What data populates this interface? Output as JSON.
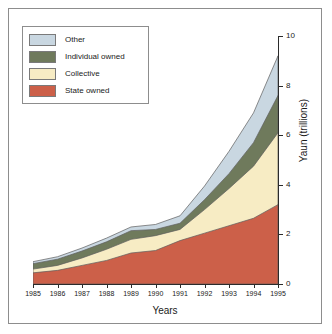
{
  "chart_data": {
    "type": "area",
    "title": "",
    "subtitle": "",
    "xlabel": "Years",
    "ylabel": "Yaun (trillions)",
    "x": [
      1985,
      1986,
      1987,
      1988,
      1989,
      1990,
      1991,
      1992,
      1993,
      1994,
      1995
    ],
    "categories": [
      "1985",
      "1986",
      "1987",
      "1988",
      "1989",
      "1990",
      "1991",
      "1992",
      "1993",
      "1994",
      "1995"
    ],
    "stacked": true,
    "series": [
      {
        "name": "State owned",
        "color": "#cc6049",
        "values": [
          0.45,
          0.55,
          0.75,
          0.95,
          1.25,
          1.35,
          1.75,
          2.05,
          2.35,
          2.65,
          3.2
        ]
      },
      {
        "name": "Collective",
        "color": "#f7ecc4",
        "values": [
          0.15,
          0.2,
          0.3,
          0.45,
          0.55,
          0.6,
          0.45,
          0.95,
          1.5,
          2.1,
          2.9
        ]
      },
      {
        "name": "Individual owned",
        "color": "#6f7a5c",
        "values": [
          0.22,
          0.25,
          0.28,
          0.3,
          0.35,
          0.25,
          0.25,
          0.4,
          0.6,
          0.95,
          1.5
        ]
      },
      {
        "name": "Other",
        "color": "#c9d7e1",
        "values": [
          0.08,
          0.1,
          0.12,
          0.15,
          0.15,
          0.2,
          0.3,
          0.55,
          0.9,
          1.2,
          1.6
        ]
      }
    ],
    "cumulative_tops": {
      "state_owned": [
        0.45,
        0.55,
        0.75,
        0.95,
        1.25,
        1.35,
        1.75,
        2.05,
        2.35,
        2.65,
        3.2
      ],
      "collective": [
        0.6,
        0.75,
        1.05,
        1.4,
        1.8,
        1.95,
        2.2,
        3.0,
        3.85,
        4.75,
        6.1
      ],
      "individual_owned": [
        0.82,
        1.0,
        1.33,
        1.7,
        2.15,
        2.2,
        2.45,
        3.4,
        4.45,
        5.7,
        7.6
      ],
      "other": [
        0.9,
        1.1,
        1.45,
        1.85,
        2.3,
        2.4,
        2.75,
        3.95,
        5.35,
        6.9,
        9.2
      ]
    },
    "ylim": [
      0,
      10
    ],
    "xlim": [
      1985,
      1995
    ],
    "y_ticks": [
      0,
      2,
      4,
      6,
      8,
      10
    ],
    "y_tick_labels": [
      "0",
      "2",
      "4",
      "6",
      "8",
      "10"
    ],
    "y_axis_position": "right",
    "grid": false,
    "legend_position": "top-left",
    "legend_entries": [
      {
        "label": "Other",
        "color": "#c9d7e1"
      },
      {
        "label": "Individual owned",
        "color": "#6f7a5c"
      },
      {
        "label": "Collective",
        "color": "#f7ecc4"
      },
      {
        "label": "State owned",
        "color": "#cc6049"
      }
    ]
  },
  "colors": {
    "other": "#c9d7e1",
    "individual_owned": "#6f7a5c",
    "collective": "#f7ecc4",
    "state_owned": "#cc6049",
    "axis": "#2b2b2b",
    "frame": "#8d8d8d",
    "background": "#ffffff",
    "text": "#1a1a1a"
  }
}
